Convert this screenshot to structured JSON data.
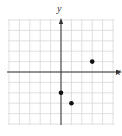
{
  "chart_data": {
    "type": "scatter",
    "title": "",
    "xlabel": "x",
    "ylabel": "y",
    "xlim": [
      -5,
      5
    ],
    "ylim": [
      -5,
      5
    ],
    "grid": true,
    "tick_labels": false,
    "points": [
      {
        "x": 3,
        "y": 1
      },
      {
        "x": 0,
        "y": -2
      },
      {
        "x": 1,
        "y": -3
      }
    ]
  },
  "axes": {
    "x_label": "x",
    "y_label": "y"
  },
  "colors": {
    "grid": "#d8d8d8",
    "axis": "#333333",
    "point": "#111111"
  }
}
